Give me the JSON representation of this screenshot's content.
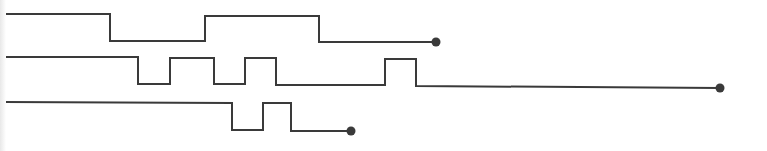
{
  "diagram": {
    "type": "timing-waveforms",
    "stroke_color": "#3a3a3a",
    "stroke_width": 2,
    "endpoint_radius": 4.5,
    "signals": [
      {
        "name": "signal-1",
        "high_y": 14,
        "low_y": 41,
        "points": [
          [
            5,
            14
          ],
          [
            110,
            14
          ],
          [
            110,
            41
          ],
          [
            205,
            41
          ],
          [
            205,
            16
          ],
          [
            319,
            16
          ],
          [
            319,
            42
          ],
          [
            436,
            42
          ]
        ],
        "endpoint": [
          436,
          42
        ]
      },
      {
        "name": "signal-2",
        "high_y": 57,
        "low_y": 84,
        "points": [
          [
            5,
            57
          ],
          [
            138,
            57
          ],
          [
            138,
            84
          ],
          [
            170,
            84
          ],
          [
            170,
            58
          ],
          [
            214,
            58
          ],
          [
            214,
            84
          ],
          [
            245,
            84
          ],
          [
            245,
            58
          ],
          [
            276,
            58
          ],
          [
            276,
            85
          ],
          [
            385,
            85
          ],
          [
            385,
            59
          ],
          [
            416,
            59
          ],
          [
            416,
            86
          ],
          [
            720,
            88
          ]
        ],
        "endpoint": [
          720,
          88
        ]
      },
      {
        "name": "signal-3",
        "high_y": 103,
        "low_y": 130,
        "points": [
          [
            4,
            102
          ],
          [
            232,
            103
          ],
          [
            232,
            130
          ],
          [
            263,
            130
          ],
          [
            263,
            103
          ],
          [
            291,
            103
          ],
          [
            291,
            131
          ],
          [
            351,
            131
          ]
        ],
        "endpoint": [
          351,
          131
        ]
      }
    ]
  }
}
